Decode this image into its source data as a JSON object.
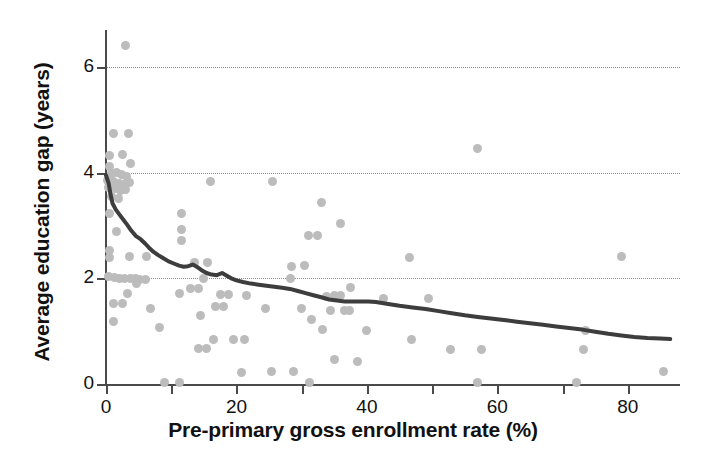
{
  "chart_data": {
    "type": "scatter",
    "title": "",
    "xlabel": "Pre-primary gross enrollment rate (%)",
    "ylabel": "Average education gap (years)",
    "xlim": [
      0,
      88
    ],
    "ylim": [
      0,
      6.7
    ],
    "xticks": [
      0,
      20,
      40,
      60,
      80
    ],
    "xticklabels": [
      "0",
      "20",
      "40",
      "60",
      "80"
    ],
    "xminorticks": [
      10,
      30,
      50,
      70
    ],
    "yticks": [
      0,
      2,
      4,
      6
    ],
    "yticklabels": [
      "0",
      "2",
      "4",
      "6"
    ],
    "gridlines_y": [
      2,
      4,
      6
    ],
    "grid": "horizontal-dotted",
    "legend": "none",
    "point_color": "#bcbcbc",
    "line_color": "#3d3d3d",
    "axis_color": "#4a4a4a",
    "series": [
      {
        "name": "countries",
        "type": "scatter",
        "points": [
          [
            3.0,
            6.4
          ],
          [
            1.2,
            4.75
          ],
          [
            3.4,
            4.75
          ],
          [
            0.6,
            4.32
          ],
          [
            2.6,
            4.35
          ],
          [
            0.5,
            4.12
          ],
          [
            3.8,
            4.18
          ],
          [
            0.8,
            3.98
          ],
          [
            1.6,
            4.0
          ],
          [
            2.4,
            3.96
          ],
          [
            3.1,
            3.92
          ],
          [
            0.3,
            3.86
          ],
          [
            1.1,
            3.84
          ],
          [
            2.0,
            3.8
          ],
          [
            2.8,
            3.78
          ],
          [
            3.6,
            3.82
          ],
          [
            0.4,
            3.72
          ],
          [
            1.4,
            3.7
          ],
          [
            2.2,
            3.66
          ],
          [
            3.0,
            3.68
          ],
          [
            0.9,
            3.55
          ],
          [
            1.9,
            3.52
          ],
          [
            0.6,
            3.22
          ],
          [
            16.0,
            3.84
          ],
          [
            25.5,
            3.84
          ],
          [
            33.0,
            3.44
          ],
          [
            11.5,
            3.22
          ],
          [
            36.0,
            3.04
          ],
          [
            11.5,
            2.92
          ],
          [
            1.6,
            2.88
          ],
          [
            31.0,
            2.82
          ],
          [
            32.4,
            2.82
          ],
          [
            11.5,
            2.72
          ],
          [
            0.5,
            2.52
          ],
          [
            0.5,
            2.4
          ],
          [
            3.6,
            2.42
          ],
          [
            6.2,
            2.42
          ],
          [
            46.5,
            2.4
          ],
          [
            79.0,
            2.42
          ],
          [
            13.5,
            2.3
          ],
          [
            15.6,
            2.3
          ],
          [
            28.5,
            2.22
          ],
          [
            30.5,
            2.25
          ],
          [
            0.4,
            2.04
          ],
          [
            1.3,
            2.02
          ],
          [
            2.1,
            2.0
          ],
          [
            2.9,
            2.0
          ],
          [
            3.7,
            1.99
          ],
          [
            4.5,
            1.99
          ],
          [
            5.2,
            1.98
          ],
          [
            6.0,
            1.98
          ],
          [
            15.0,
            2.0
          ],
          [
            28.3,
            2.0
          ],
          [
            4.6,
            1.9
          ],
          [
            13.0,
            1.8
          ],
          [
            14.2,
            1.8
          ],
          [
            37.5,
            1.82
          ],
          [
            3.3,
            1.72
          ],
          [
            11.2,
            1.72
          ],
          [
            17.5,
            1.7
          ],
          [
            18.8,
            1.7
          ],
          [
            21.5,
            1.68
          ],
          [
            33.8,
            1.66
          ],
          [
            35.0,
            1.68
          ],
          [
            35.9,
            1.68
          ],
          [
            42.5,
            1.62
          ],
          [
            49.5,
            1.62
          ],
          [
            1.2,
            1.52
          ],
          [
            2.5,
            1.52
          ],
          [
            6.8,
            1.42
          ],
          [
            16.8,
            1.46
          ],
          [
            18.0,
            1.46
          ],
          [
            24.5,
            1.42
          ],
          [
            30.0,
            1.42
          ],
          [
            34.4,
            1.4
          ],
          [
            36.5,
            1.4
          ],
          [
            37.4,
            1.4
          ],
          [
            14.5,
            1.3
          ],
          [
            31.5,
            1.22
          ],
          [
            1.2,
            1.18
          ],
          [
            8.2,
            1.06
          ],
          [
            33.2,
            1.04
          ],
          [
            40.0,
            1.02
          ],
          [
            73.5,
            1.02
          ],
          [
            16.5,
            0.84
          ],
          [
            19.5,
            0.84
          ],
          [
            21.2,
            0.84
          ],
          [
            46.8,
            0.84
          ],
          [
            14.2,
            0.68
          ],
          [
            15.4,
            0.68
          ],
          [
            52.8,
            0.66
          ],
          [
            57.5,
            0.66
          ],
          [
            73.2,
            0.66
          ],
          [
            35.0,
            0.46
          ],
          [
            38.6,
            0.42
          ],
          [
            20.8,
            0.22
          ],
          [
            25.4,
            0.24
          ],
          [
            28.8,
            0.24
          ],
          [
            85.5,
            0.24
          ],
          [
            57.0,
            4.45
          ],
          [
            9.0,
            0.02
          ],
          [
            11.2,
            0.02
          ],
          [
            31.2,
            0.02
          ],
          [
            57.0,
            0.02
          ],
          [
            72.2,
            0.02
          ]
        ]
      },
      {
        "name": "lowess-trend",
        "type": "line",
        "points": [
          [
            0.0,
            3.95
          ],
          [
            0.4,
            3.8
          ],
          [
            0.7,
            3.58
          ],
          [
            1.0,
            3.42
          ],
          [
            1.5,
            3.3
          ],
          [
            2.1,
            3.2
          ],
          [
            2.6,
            3.12
          ],
          [
            3.2,
            3.02
          ],
          [
            3.9,
            2.9
          ],
          [
            4.6,
            2.8
          ],
          [
            5.3,
            2.74
          ],
          [
            6.0,
            2.66
          ],
          [
            6.6,
            2.58
          ],
          [
            7.3,
            2.5
          ],
          [
            8.0,
            2.44
          ],
          [
            8.8,
            2.38
          ],
          [
            9.6,
            2.32
          ],
          [
            10.4,
            2.28
          ],
          [
            11.2,
            2.24
          ],
          [
            11.9,
            2.22
          ],
          [
            12.6,
            2.23
          ],
          [
            13.3,
            2.26
          ],
          [
            13.9,
            2.22
          ],
          [
            14.6,
            2.16
          ],
          [
            15.4,
            2.1
          ],
          [
            16.2,
            2.07
          ],
          [
            17.0,
            2.06
          ],
          [
            17.8,
            2.1
          ],
          [
            18.4,
            2.06
          ],
          [
            19.2,
            2.0
          ],
          [
            20.0,
            1.96
          ],
          [
            21.0,
            1.93
          ],
          [
            22.2,
            1.9
          ],
          [
            23.4,
            1.88
          ],
          [
            24.6,
            1.86
          ],
          [
            25.8,
            1.84
          ],
          [
            27.0,
            1.82
          ],
          [
            28.2,
            1.8
          ],
          [
            29.4,
            1.76
          ],
          [
            30.6,
            1.72
          ],
          [
            31.8,
            1.68
          ],
          [
            33.0,
            1.64
          ],
          [
            34.2,
            1.6
          ],
          [
            35.4,
            1.58
          ],
          [
            36.6,
            1.56
          ],
          [
            37.8,
            1.56
          ],
          [
            39.0,
            1.56
          ],
          [
            40.2,
            1.56
          ],
          [
            41.4,
            1.55
          ],
          [
            43.0,
            1.52
          ],
          [
            45.0,
            1.48
          ],
          [
            47.0,
            1.45
          ],
          [
            49.0,
            1.42
          ],
          [
            51.0,
            1.38
          ],
          [
            53.0,
            1.34
          ],
          [
            55.0,
            1.3
          ],
          [
            57.0,
            1.27
          ],
          [
            59.0,
            1.24
          ],
          [
            61.0,
            1.21
          ],
          [
            63.0,
            1.18
          ],
          [
            65.0,
            1.15
          ],
          [
            67.0,
            1.12
          ],
          [
            69.0,
            1.09
          ],
          [
            71.0,
            1.06
          ],
          [
            73.0,
            1.03
          ],
          [
            75.0,
            0.99
          ],
          [
            77.0,
            0.95
          ],
          [
            79.0,
            0.92
          ],
          [
            81.0,
            0.89
          ],
          [
            83.0,
            0.87
          ],
          [
            85.0,
            0.86
          ],
          [
            86.5,
            0.85
          ]
        ]
      }
    ]
  }
}
